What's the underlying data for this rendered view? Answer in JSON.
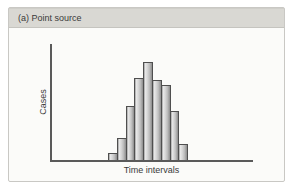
{
  "panel": {
    "header": "(a) Point source"
  },
  "chart_data": {
    "type": "bar",
    "title": "(a) Point source",
    "xlabel": "Time intervals",
    "ylabel": "Cases",
    "bars_count": 9,
    "values_relative_pct": [
      7,
      22,
      55,
      84,
      100,
      82,
      77,
      50,
      16
    ],
    "x_tick_labels": [],
    "y_tick_labels": [],
    "grid": "off",
    "legend": "none",
    "note": "Epidemic-curve style histogram; no numeric axis scale shown, values are bar heights as percent of the tallest bar",
    "colors": {
      "header_bg": "#d9d8d3",
      "panel_bg": "#fbfbf9",
      "panel_border": "#c9c8c4",
      "axis": "#5a5a5a",
      "bar_fill_light": "#e7e7e7",
      "bar_fill_dark": "#8d8d8d",
      "bar_border": "#4f4f4f",
      "text": "#3a3a3a"
    }
  }
}
